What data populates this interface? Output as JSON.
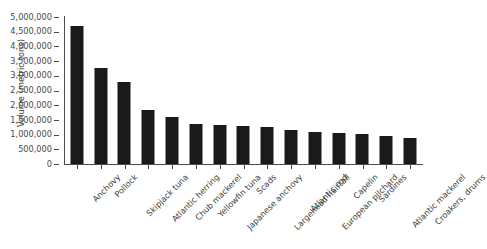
{
  "chart_data": {
    "type": "bar",
    "title": "",
    "xlabel": "",
    "ylabel": "Volume (metric tons)",
    "ylim": [
      0,
      5000000
    ],
    "ytick_step": 500000,
    "grid": false,
    "legend": false,
    "bar_color": "#1a1a1a",
    "categories": [
      "Anchovy",
      "Pollock",
      "Skipjack tuna",
      "Atlantic herring",
      "Chub mackerel",
      "Yellowfin tuna",
      "Japanese anchovy",
      "Scads",
      "Largehead hairtail",
      "Atlantic cod",
      "European pilchard",
      "Capelin",
      "Sardines",
      "Atlantic mackerel",
      "Croakers, drums"
    ],
    "values": [
      4700000,
      3250000,
      2780000,
      1830000,
      1600000,
      1370000,
      1330000,
      1300000,
      1270000,
      1150000,
      1100000,
      1060000,
      1020000,
      950000,
      900000
    ],
    "ytick_labels": [
      "5,000,000",
      "4,500,000",
      "4,000,000",
      "3,500,000",
      "3,000,000",
      "2,500,000",
      "2,000,000",
      "1,500,000",
      "1,000,000",
      "500,000",
      "0"
    ],
    "ytick_values": [
      5000000,
      4500000,
      4000000,
      3500000,
      3000000,
      2500000,
      2000000,
      1500000,
      1000000,
      500000,
      0
    ]
  }
}
